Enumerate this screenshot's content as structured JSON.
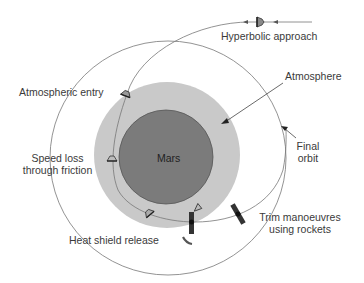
{
  "diagram": {
    "title": "",
    "colors": {
      "atmosphere": "#c8c8c8",
      "planet": "#7a7a7a",
      "line": "#6e6e6e",
      "text": "#3a3a3a",
      "spacecraft": "#444444"
    },
    "labels": {
      "hyperbolic_approach": "Hyperbolic approach",
      "atmosphere": "Atmosphere",
      "atmospheric_entry": "Atmospheric entry",
      "mars": "Mars",
      "final_orbit_line1": "Final",
      "final_orbit_line2": "orbit",
      "speed_loss_line1": "Speed loss",
      "speed_loss_line2": "through friction",
      "trim_line1": "Trim manoeuvres",
      "trim_line2": "using rockets",
      "heat_shield_release": "Heat shield release"
    },
    "elements": [
      "Mars (planet)",
      "Atmosphere (shaded ring)",
      "Final orbit (large circle)",
      "Aerocapture trajectory from hyperbolic approach",
      "Entry capsule icons along trajectory",
      "Orbiter icons (post heat shield release)",
      "Discarded heat shield"
    ]
  }
}
